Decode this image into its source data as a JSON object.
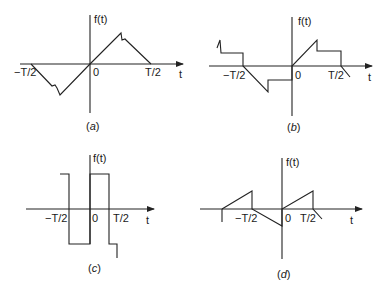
{
  "figure": {
    "panels": [
      {
        "id": "a",
        "caption_open": "(",
        "caption_letter": "a",
        "caption_close": ")",
        "y_axis_label": "f(t)",
        "x_axis_label": "t",
        "tick_labels": {
          "neg_half": "−T/2",
          "zero": "0",
          "pos_half": "T/2"
        },
        "description": "Odd triangular-like waveform with small notch near peaks"
      },
      {
        "id": "b",
        "caption_open": "(",
        "caption_letter": "b",
        "caption_close": ")",
        "y_axis_label": "f(t)",
        "x_axis_label": "t",
        "tick_labels": {
          "neg_half": "−T/2",
          "zero": "0",
          "pos_half": "T/2"
        },
        "description": "Ramp then step waveform, odd symmetry"
      },
      {
        "id": "c",
        "caption_open": "(",
        "caption_letter": "c",
        "caption_close": ")",
        "y_axis_label": "f(t)",
        "x_axis_label": "t",
        "tick_labels": {
          "neg_half": "−T/2",
          "zero": "0",
          "pos_half": "T/2"
        },
        "description": "Square wave"
      },
      {
        "id": "d",
        "caption_open": "(",
        "caption_letter": "d",
        "caption_close": ")",
        "y_axis_label": "f(t)",
        "x_axis_label": "t",
        "tick_labels": {
          "neg_half": "−T/2",
          "zero": "0",
          "pos_half": "T/2"
        },
        "description": "Sawtooth-like waveform with half-wave ramps"
      }
    ]
  }
}
